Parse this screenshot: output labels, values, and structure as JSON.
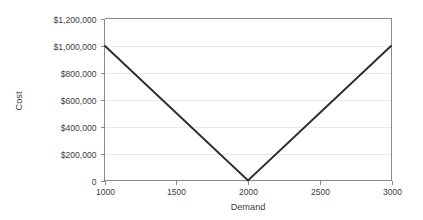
{
  "chart_data": {
    "type": "line",
    "title": "",
    "xlabel": "Demand",
    "ylabel": "Cost",
    "x": [
      1000,
      2000,
      3000
    ],
    "values": [
      1000000,
      0,
      1000000
    ],
    "series": [
      {
        "name": "Cost",
        "x": [
          1000,
          2000,
          3000
        ],
        "values": [
          1000000,
          0,
          1000000
        ],
        "color": "#2b2b2b"
      }
    ],
    "xlim": [
      1000,
      3000
    ],
    "ylim": [
      0,
      1200000
    ],
    "x_ticks": [
      1000,
      1500,
      2000,
      2500,
      3000
    ],
    "x_tick_labels": [
      "1000",
      "1500",
      "2000",
      "2500",
      "3000"
    ],
    "y_ticks": [
      0,
      200000,
      400000,
      600000,
      800000,
      1000000,
      1200000
    ],
    "y_tick_labels": [
      "0",
      "$200,000",
      "$400,000",
      "$600,000",
      "$800,000",
      "$1,000,000",
      "$1,200,000"
    ],
    "grid": true,
    "grid_axis": "y",
    "legend": false,
    "legend_position": "none",
    "background_color": "#ffffff",
    "grid_color": "#e9e9e9",
    "axis_color": "#8a8a8a",
    "text_color": "#3c3c3c",
    "annotations": []
  }
}
